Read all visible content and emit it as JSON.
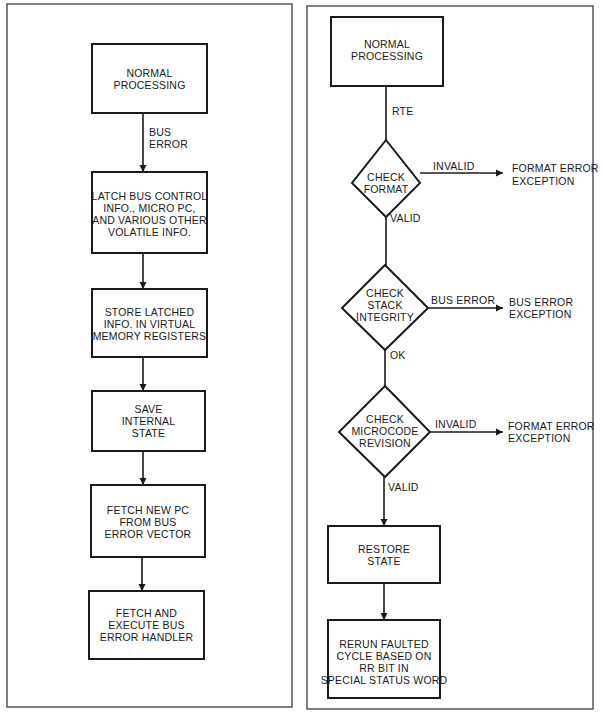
{
  "left_flowchart": {
    "nodes": [
      {
        "id": "normal-processing",
        "lines": [
          "NORMAL",
          "PROCESSING"
        ]
      },
      {
        "id": "latch-info",
        "lines": [
          "LATCH BUS CONTROL",
          "INFO., MICRO PC,",
          "AND VARIOUS OTHER",
          "VOLATILE INFO."
        ]
      },
      {
        "id": "store-latched",
        "lines": [
          "STORE LATCHED",
          "INFO. IN VIRTUAL",
          "MEMORY REGISTERS"
        ]
      },
      {
        "id": "save-state",
        "lines": [
          "SAVE",
          "INTERNAL",
          "STATE"
        ]
      },
      {
        "id": "fetch-new-pc",
        "lines": [
          "FETCH NEW PC",
          "FROM BUS",
          "ERROR VECTOR"
        ]
      },
      {
        "id": "execute-handler",
        "lines": [
          "FETCH AND",
          "EXECUTE BUS",
          "ERROR HANDLER"
        ]
      }
    ],
    "edge_labels": {
      "bus_error": [
        "BUS",
        "ERROR"
      ]
    }
  },
  "right_flowchart": {
    "nodes": {
      "normal_processing": [
        "NORMAL",
        "PROCESSING"
      ],
      "check_format": [
        "CHECK",
        "FORMAT"
      ],
      "check_stack": [
        "CHECK",
        "STACK",
        "INTEGRITY"
      ],
      "check_microcode": [
        "CHECK",
        "MICROCODE",
        "REVISION"
      ],
      "restore_state": [
        "RESTORE",
        "STATE"
      ],
      "rerun_cycle": [
        "RERUN FAULTED",
        "CYCLE BASED ON",
        "RR BIT IN",
        "SPECIAL STATUS WORD"
      ]
    },
    "exceptions": {
      "format_error_1": [
        "FORMAT ERROR",
        "EXCEPTION"
      ],
      "bus_error": [
        "BUS ERROR",
        "EXCEPTION"
      ],
      "format_error_2": [
        "FORMAT ERROR",
        "EXCEPTION"
      ]
    },
    "edge_labels": {
      "rte": "RTE",
      "format_invalid": "INVALID",
      "format_valid": "VALID",
      "stack_bus_error": "BUS ERROR",
      "stack_ok": "OK",
      "microcode_invalid": "INVALID",
      "microcode_valid": "VALID"
    }
  },
  "colors": {
    "line": "#1a1a1a",
    "panel_border": "#4a4a4a",
    "background": "#ffffff"
  }
}
